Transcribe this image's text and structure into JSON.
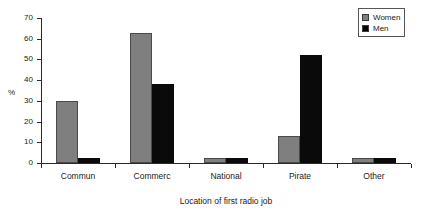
{
  "chart_data": {
    "type": "bar",
    "title": "",
    "xlabel": "Location of first radio job",
    "ylabel": "%",
    "categories": [
      "Commun",
      "Commerc",
      "National",
      "Pirate",
      "Other"
    ],
    "series": [
      {
        "name": "Women",
        "color": "#7f7f7f",
        "values": [
          30,
          63,
          2.5,
          13,
          2.5
        ]
      },
      {
        "name": "Men",
        "color": "#000000",
        "values": [
          2.5,
          38,
          2.5,
          52,
          2.5
        ]
      }
    ],
    "ylim": [
      0,
      70
    ],
    "yticks": [
      0,
      10,
      20,
      30,
      40,
      50,
      60,
      70
    ],
    "ytick_labels": [
      "0",
      "10",
      "20",
      "30",
      "40",
      "50",
      "60",
      "70"
    ],
    "grid": false,
    "legend_position": "top-right"
  },
  "legend": {
    "entries": [
      {
        "label": "Women",
        "swatch": "#7f7f7f"
      },
      {
        "label": "Men",
        "swatch": "#000000"
      }
    ]
  },
  "axes": {
    "y_title": "%",
    "x_title": "Location of first radio job"
  }
}
